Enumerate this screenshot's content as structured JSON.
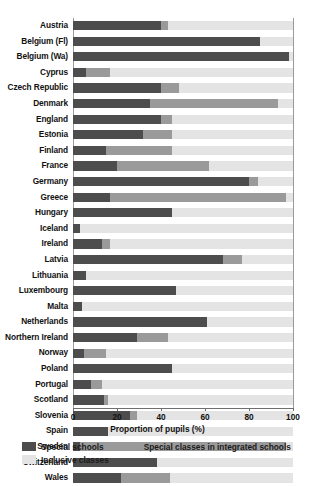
{
  "chart_data": {
    "type": "bar",
    "orientation": "horizontal",
    "stacked": true,
    "title": "",
    "xlabel": "Proportion of pupils (%)",
    "ylabel": "",
    "xlim": [
      0,
      100
    ],
    "xticks": [
      0,
      20,
      40,
      60,
      80,
      100
    ],
    "xtick_labels": [
      "0",
      "20",
      "40",
      "60",
      "80",
      "100"
    ],
    "grid": true,
    "grid_axis": "x",
    "legend_position": "below",
    "legend": [
      {
        "name": "Special schools",
        "color": "#4d4d4d"
      },
      {
        "name": "Special classes in integrated schools",
        "color": "#9a9a9a"
      },
      {
        "name": "Inclusive classes",
        "color": "#e4e4e4"
      }
    ],
    "categories": [
      "Austria",
      "Belgium (Fl)",
      "Belgium (Wa)",
      "Cyprus",
      "Czech Republic",
      "Denmark",
      "England",
      "Estonia",
      "Finland",
      "France",
      "Germany",
      "Greece",
      "Hungary",
      "Iceland",
      "Ireland",
      "Latvia",
      "Lithuania",
      "Luxembourg",
      "Malta",
      "Netherlands",
      "Northern Ireland",
      "Norway",
      "Poland",
      "Portugal",
      "Scotland",
      "Slovenia",
      "Spain",
      "Sweden",
      "Switzerland",
      "Wales"
    ],
    "series": [
      {
        "name": "Special schools",
        "color": "#4d4d4d",
        "values": [
          40,
          85,
          98,
          6,
          40,
          35,
          40,
          32,
          15,
          20,
          80,
          17,
          45,
          3,
          13,
          68,
          6,
          47,
          4,
          61,
          29,
          5,
          45,
          8,
          14,
          26,
          16,
          3,
          38,
          22
        ]
      },
      {
        "name": "Special classes in integrated schools",
        "color": "#9a9a9a",
        "values": [
          3,
          0,
          0,
          11,
          8,
          58,
          5,
          13,
          30,
          42,
          4,
          80,
          0,
          0,
          4,
          9,
          0,
          0,
          0,
          0,
          14,
          10,
          0,
          5,
          2,
          3,
          0,
          94,
          0,
          22
        ]
      },
      {
        "name": "Inclusive classes",
        "color": "#e4e4e4",
        "values": [
          57,
          15,
          2,
          83,
          52,
          7,
          55,
          55,
          55,
          38,
          16,
          3,
          55,
          97,
          83,
          23,
          94,
          53,
          96,
          39,
          57,
          85,
          55,
          87,
          84,
          71,
          84,
          3,
          62,
          56
        ]
      }
    ]
  }
}
